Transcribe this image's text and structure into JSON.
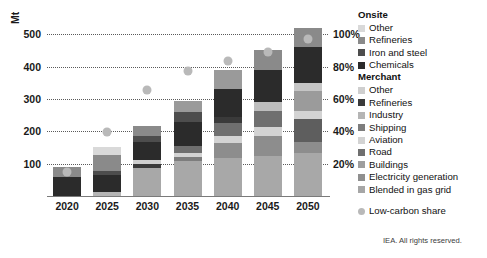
{
  "chart_data": {
    "type": "bar",
    "stacked": true,
    "title": "",
    "xlabel": "",
    "ylabel": "Mt",
    "categories": [
      "2020",
      "2025",
      "2030",
      "2035",
      "2040",
      "2045",
      "2050"
    ],
    "ylim": [
      0,
      550
    ],
    "yticks": [
      100,
      200,
      300,
      400,
      500
    ],
    "y2label": "",
    "y2lim": [
      0,
      110
    ],
    "y2ticks": [
      "20%",
      "40%",
      "60%",
      "80%",
      "100%"
    ],
    "grid": true,
    "legend_position": "right",
    "series": [
      {
        "name": "Merchant: Blended in gas grid",
        "color": "#a6a6a6",
        "values": [
          0,
          0,
          0,
          0,
          0,
          0,
          0
        ]
      },
      {
        "name": "Merchant: Electricity generation",
        "color": "#9b9b9b",
        "values": [
          0,
          0,
          0,
          0,
          0,
          0,
          0
        ]
      },
      {
        "name": "Merchant: Buildings",
        "color": "#8f8f8f",
        "values": [
          0,
          0,
          0,
          0,
          0,
          0,
          0
        ]
      },
      {
        "name": "Merchant: Road",
        "color": "#6f6f6f",
        "values": [
          0,
          0,
          0,
          0,
          0,
          0,
          0
        ]
      },
      {
        "name": "Merchant: Aviation",
        "color": "#d3d3d3",
        "values": [
          0,
          0,
          0,
          0,
          0,
          0,
          0
        ]
      },
      {
        "name": "Merchant: Shipping",
        "color": "#7d7d7d",
        "values": [
          0,
          0,
          0,
          0,
          0,
          0,
          0
        ]
      },
      {
        "name": "Merchant: Industry",
        "color": "#b5b5b5",
        "values": [
          0,
          0,
          0,
          0,
          0,
          0,
          0
        ]
      },
      {
        "name": "Merchant: Refineries",
        "color": "#3a3a3a",
        "values": [
          0,
          0,
          0,
          0,
          0,
          0,
          0
        ]
      },
      {
        "name": "Merchant: Other",
        "color": "#cfcfcf",
        "values": [
          0,
          0,
          0,
          0,
          0,
          0,
          0
        ]
      },
      {
        "name": "Onsite: Chemicals",
        "color": "#2b2b2b",
        "values": [
          0,
          0,
          0,
          0,
          0,
          0,
          0
        ]
      },
      {
        "name": "Onsite: Iron and steel",
        "color": "#4d4d4d",
        "values": [
          0,
          0,
          0,
          0,
          0,
          0,
          0
        ]
      },
      {
        "name": "Onsite: Refineries",
        "color": "#8a8a8a",
        "values": [
          0,
          0,
          0,
          0,
          0,
          0,
          0
        ]
      },
      {
        "name": "Onsite: Other",
        "color": "#d9d9d9",
        "values": [
          0,
          0,
          0,
          0,
          0,
          0,
          0
        ]
      }
    ],
    "totals": [
      90,
      150,
      215,
      295,
      390,
      450,
      520
    ],
    "low_carbon_share": {
      "name": "Low-carbon share",
      "color": "#b9b9b9",
      "values_pct": [
        18,
        42,
        66,
        78,
        88,
        92,
        100
      ],
      "values_mt": [
        88,
        212,
        340,
        400,
        430,
        460,
        500
      ]
    },
    "bars": [
      {
        "category": "2020",
        "total": 90,
        "segments": [
          {
            "name": "Onsite: Chemicals",
            "value": 58,
            "color": "#2b2b2b"
          },
          {
            "name": "Onsite: Refineries",
            "value": 32,
            "color": "#8a8a8a"
          }
        ]
      },
      {
        "category": "2025",
        "total": 150,
        "segments": [
          {
            "name": "Merchant: Industry",
            "value": 12,
            "color": "#b5b5b5"
          },
          {
            "name": "Onsite: Chemicals",
            "value": 52,
            "color": "#2b2b2b"
          },
          {
            "name": "Onsite: Iron and steel",
            "value": 14,
            "color": "#4d4d4d"
          },
          {
            "name": "Onsite: Refineries",
            "value": 50,
            "color": "#8a8a8a"
          },
          {
            "name": "Onsite: Other",
            "value": 22,
            "color": "#d9d9d9"
          }
        ]
      },
      {
        "category": "2030",
        "total": 215,
        "segments": [
          {
            "name": "Merchant: Industry",
            "value": 88,
            "color": "#a8a8a8"
          },
          {
            "name": "Merchant: Refineries",
            "value": 12,
            "color": "#3a3a3a"
          },
          {
            "name": "Merchant: Other",
            "value": 10,
            "color": "#cfcfcf"
          },
          {
            "name": "Onsite: Chemicals",
            "value": 58,
            "color": "#2b2b2b"
          },
          {
            "name": "Onsite: Iron and steel",
            "value": 18,
            "color": "#4d4d4d"
          },
          {
            "name": "Onsite: Refineries",
            "value": 29,
            "color": "#8a8a8a"
          }
        ]
      },
      {
        "category": "2035",
        "total": 295,
        "segments": [
          {
            "name": "Merchant: Industry",
            "value": 108,
            "color": "#a8a8a8"
          },
          {
            "name": "Merchant: Shipping",
            "value": 14,
            "color": "#7d7d7d"
          },
          {
            "name": "Merchant: Aviation",
            "value": 12,
            "color": "#d3d3d3"
          },
          {
            "name": "Merchant: Road",
            "value": 22,
            "color": "#6f6f6f"
          },
          {
            "name": "Onsite: Chemicals",
            "value": 74,
            "color": "#2b2b2b"
          },
          {
            "name": "Onsite: Iron and steel",
            "value": 30,
            "color": "#4d4d4d"
          },
          {
            "name": "Onsite: Refineries",
            "value": 35,
            "color": "#9a9a9a"
          }
        ]
      },
      {
        "category": "2040",
        "total": 390,
        "segments": [
          {
            "name": "Merchant: Industry",
            "value": 118,
            "color": "#a8a8a8"
          },
          {
            "name": "Merchant: Shipping",
            "value": 46,
            "color": "#8d8d8d"
          },
          {
            "name": "Merchant: Aviation",
            "value": 22,
            "color": "#d3d3d3"
          },
          {
            "name": "Merchant: Road",
            "value": 40,
            "color": "#6f6f6f"
          },
          {
            "name": "Merchant: Refineries",
            "value": 18,
            "color": "#3a3a3a"
          },
          {
            "name": "Onsite: Chemicals",
            "value": 86,
            "color": "#2b2b2b"
          },
          {
            "name": "Onsite: Refineries",
            "value": 60,
            "color": "#9a9a9a"
          }
        ]
      },
      {
        "category": "2045",
        "total": 450,
        "segments": [
          {
            "name": "Merchant: Industry",
            "value": 124,
            "color": "#a8a8a8"
          },
          {
            "name": "Merchant: Shipping",
            "value": 60,
            "color": "#8d8d8d"
          },
          {
            "name": "Merchant: Aviation",
            "value": 30,
            "color": "#d3d3d3"
          },
          {
            "name": "Merchant: Road",
            "value": 48,
            "color": "#6f6f6f"
          },
          {
            "name": "Merchant: Buildings",
            "value": 28,
            "color": "#bdbdbd"
          },
          {
            "name": "Onsite: Chemicals",
            "value": 98,
            "color": "#2b2b2b"
          },
          {
            "name": "Onsite: Refineries",
            "value": 62,
            "color": "#8a8a8a"
          }
        ]
      },
      {
        "category": "2050",
        "total": 520,
        "segments": [
          {
            "name": "Merchant: Industry",
            "value": 132,
            "color": "#a8a8a8"
          },
          {
            "name": "Merchant: Shipping",
            "value": 34,
            "color": "#8d8d8d"
          },
          {
            "name": "Merchant: Aviation",
            "value": 72,
            "color": "#5e5e5e"
          },
          {
            "name": "Merchant: Road",
            "value": 26,
            "color": "#d3d3d3"
          },
          {
            "name": "Merchant: Electricity generation",
            "value": 62,
            "color": "#9b9b9b"
          },
          {
            "name": "Merchant: Blended in gas grid",
            "value": 22,
            "color": "#c5c5c5"
          },
          {
            "name": "Onsite: Chemicals",
            "value": 112,
            "color": "#2b2b2b"
          },
          {
            "name": "Onsite: Refineries",
            "value": 60,
            "color": "#8a8a8a"
          }
        ]
      }
    ]
  },
  "axes": {
    "y_left_title": "Mt",
    "y_left_ticks": [
      "500",
      "400",
      "300",
      "200",
      "100"
    ],
    "y_right_ticks": [
      "100%",
      "80%",
      "60%",
      "40%",
      "20%"
    ],
    "x_ticks": [
      "2020",
      "2025",
      "2030",
      "2035",
      "2040",
      "2045",
      "2050"
    ]
  },
  "legend": {
    "onsite_header": "Onsite",
    "onsite_items": [
      {
        "label": "Other",
        "color": "#d9d9d9"
      },
      {
        "label": "Refineries",
        "color": "#8a8a8a"
      },
      {
        "label": "Iron and steel",
        "color": "#4d4d4d"
      },
      {
        "label": "Chemicals",
        "color": "#2b2b2b"
      }
    ],
    "merchant_header": "Merchant",
    "merchant_items": [
      {
        "label": "Other",
        "color": "#cfcfcf"
      },
      {
        "label": "Refineries",
        "color": "#3a3a3a"
      },
      {
        "label": "Industry",
        "color": "#b5b5b5"
      },
      {
        "label": "Shipping",
        "color": "#7d7d7d"
      },
      {
        "label": "Aviation",
        "color": "#d3d3d3"
      },
      {
        "label": "Road",
        "color": "#6f6f6f"
      },
      {
        "label": "Buildings",
        "color": "#9e9e9e"
      },
      {
        "label": "Electricity generation",
        "color": "#8f8f8f"
      },
      {
        "label": "Blended in gas grid",
        "color": "#a6a6a6"
      }
    ],
    "low_carbon_label": "Low-carbon share",
    "low_carbon_color": "#b9b9b9"
  },
  "footer": {
    "copyright": "IEA. All rights reserved."
  }
}
